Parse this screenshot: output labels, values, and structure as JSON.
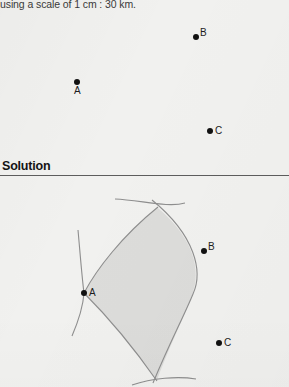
{
  "document": {
    "intro_text": "using a scale of 1 cm : 30 km.",
    "solution_heading": "Solution"
  },
  "colors": {
    "page_background": "#f1f1ef",
    "text": "#2b2b2b",
    "point_fill": "#111111",
    "rule": "#5d5d5d",
    "arc_stroke": "#8c8c8c",
    "region_fill": "#dcdcda"
  },
  "problem_figure": {
    "name": "problem-diagram",
    "points": [
      {
        "label": "A",
        "x": 77,
        "y": 68,
        "label_position": "below"
      },
      {
        "label": "B",
        "x": 196,
        "y": 23,
        "label_position": "right"
      },
      {
        "label": "C",
        "x": 210,
        "y": 117,
        "label_position": "right"
      }
    ]
  },
  "solution_figure": {
    "name": "solution-diagram",
    "points": [
      {
        "label": "A",
        "x": 84,
        "y": 113,
        "label_position": "right"
      },
      {
        "label": "B",
        "x": 204,
        "y": 71,
        "label_position": "right"
      },
      {
        "label": "C",
        "x": 219,
        "y": 163,
        "label_position": "right"
      }
    ],
    "region": {
      "name": "intersection-region",
      "description": "shaded lens where the two construction arcs overlap",
      "fill": "#dcdcda"
    },
    "arcs": [
      {
        "name": "arc-left",
        "description": "arc centred right of A passing through A"
      },
      {
        "name": "arc-right",
        "description": "large arc bulging right of the region"
      },
      {
        "name": "arc-top-short",
        "description": "short construction arc above the region"
      },
      {
        "name": "arc-bottom-short",
        "description": "short construction arc below the region"
      }
    ]
  }
}
